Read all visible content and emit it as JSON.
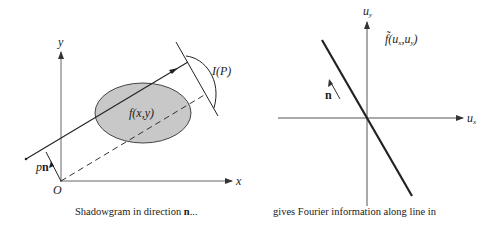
{
  "left": {
    "caption_prefix": "Shadowgram in direction ",
    "caption_bold": "n",
    "caption_suffix": "...",
    "axis_x_label": "x",
    "axis_y_label": "y",
    "origin_label": "O",
    "object_label": "f(x,y)",
    "projection_label": "I(P)",
    "offset_label_p": "p",
    "offset_label_n": "n"
  },
  "right": {
    "caption": "gives Fourier information along line in",
    "axis_x_label": "u",
    "axis_x_sub": "x",
    "axis_y_label": "u",
    "axis_y_sub": "y",
    "transform_label_prefix": "f̃(u",
    "transform_sub_x": "x",
    "transform_mid": ",u",
    "transform_sub_y": "y",
    "transform_suffix": ")",
    "direction_label": "n"
  },
  "colors": {
    "line": "#222222",
    "axis": "#555555",
    "ellipse_fill": "#c8c8c8",
    "ellipse_stroke": "#444444"
  }
}
